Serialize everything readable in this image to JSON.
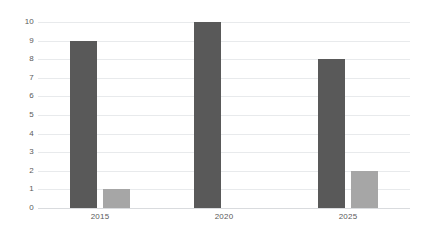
{
  "chart_data": {
    "type": "bar",
    "title": "",
    "subtitle": "",
    "xlabel": "",
    "ylabel": "",
    "categories": [
      "2015",
      "2020",
      "2025"
    ],
    "series": [
      {
        "name": "Series 1",
        "color": "#595959",
        "values": [
          9,
          10,
          8
        ]
      },
      {
        "name": "Series 2",
        "color": "#a6a6a6",
        "values": [
          1,
          0,
          2
        ]
      }
    ],
    "ylim": [
      0,
      10
    ],
    "ytick_labels": [
      "10",
      "9",
      "8",
      "7",
      "6",
      "5",
      "4",
      "3",
      "2",
      "1",
      "0"
    ],
    "ytick_values": [
      10,
      9,
      8,
      7,
      6,
      5,
      4,
      3,
      2,
      1,
      0
    ],
    "grid": true,
    "grid_axis": "y",
    "legend": false,
    "legend_position": "none",
    "annotations": [],
    "colors": {
      "background": "#ffffff",
      "gridline": "#e8eaec",
      "axis": "#d9dbde",
      "tick_text": "#5a5a5a"
    }
  }
}
